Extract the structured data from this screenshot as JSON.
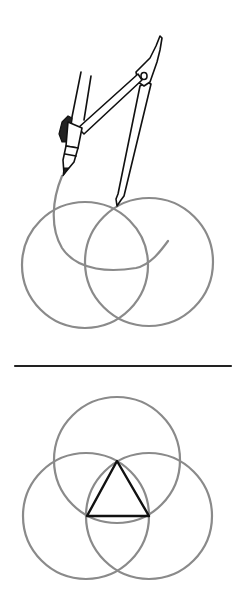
{
  "figure": {
    "colors": {
      "background": "#ffffff",
      "pencil_lines": "#8a8a8a",
      "ink_lines": "#111111"
    },
    "top_panel": {
      "circles": [
        {
          "name": "left-circle",
          "cx": 85,
          "cy": 265,
          "r": 63
        },
        {
          "name": "right-circle",
          "cx": 149,
          "cy": 262,
          "r": 64
        }
      ],
      "arc_in_progress": {
        "cx": 117,
        "cy": 222,
        "r": 64
      },
      "compass": {
        "hinge": [
          143,
          75
        ],
        "point_tip": [
          117,
          205
        ],
        "pencil_tip": [
          63,
          173
        ]
      }
    },
    "divider": {
      "x1": 15,
      "x2": 231,
      "y": 366
    },
    "bottom_panel": {
      "circles": [
        {
          "name": "top-circle",
          "cx": 117,
          "cy": 460,
          "r": 63
        },
        {
          "name": "left-circle",
          "cx": 86,
          "cy": 516,
          "r": 63
        },
        {
          "name": "right-circle",
          "cx": 149,
          "cy": 516,
          "r": 63
        }
      ],
      "triangle": [
        [
          117,
          461
        ],
        [
          87,
          516
        ],
        [
          149,
          516
        ]
      ]
    }
  }
}
